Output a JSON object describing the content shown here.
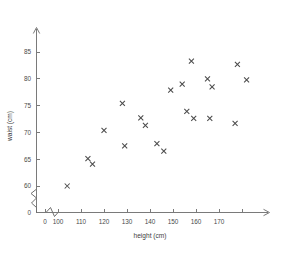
{
  "chart_data": {
    "type": "scatter",
    "title": "",
    "xlabel": "height (cm)",
    "ylabel": "waist (cm)",
    "xlim": [
      100,
      180
    ],
    "ylim": [
      60,
      87
    ],
    "x_ticks": [
      0,
      100,
      110,
      120,
      130,
      140,
      150,
      160,
      170
    ],
    "y_ticks": [
      0,
      60,
      65,
      70,
      75,
      80,
      85
    ],
    "x_axis_break": true,
    "y_axis_break": true,
    "grid": false,
    "legend": null,
    "marker": "x",
    "marker_color": "#4c4c4c",
    "points": [
      {
        "x": 104,
        "y": 60.0
      },
      {
        "x": 113,
        "y": 65.1
      },
      {
        "x": 115,
        "y": 64.1
      },
      {
        "x": 120,
        "y": 70.4
      },
      {
        "x": 128,
        "y": 75.4
      },
      {
        "x": 129,
        "y": 67.5
      },
      {
        "x": 136,
        "y": 72.7
      },
      {
        "x": 138,
        "y": 71.3
      },
      {
        "x": 143,
        "y": 67.9
      },
      {
        "x": 146,
        "y": 66.5
      },
      {
        "x": 149,
        "y": 77.9
      },
      {
        "x": 154,
        "y": 79.0
      },
      {
        "x": 156,
        "y": 73.9
      },
      {
        "x": 158,
        "y": 83.3
      },
      {
        "x": 159,
        "y": 72.6
      },
      {
        "x": 165,
        "y": 80.0
      },
      {
        "x": 166,
        "y": 72.6
      },
      {
        "x": 167,
        "y": 78.5
      },
      {
        "x": 177,
        "y": 71.7
      },
      {
        "x": 178,
        "y": 82.7
      },
      {
        "x": 182,
        "y": 79.8
      }
    ]
  }
}
